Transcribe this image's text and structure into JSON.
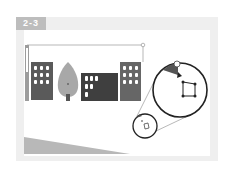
{
  "figure": {
    "label": "2-3",
    "colors": {
      "frame": "#efefef",
      "label_bg": "#bdbdbd",
      "building_dark": "#4a4a4a",
      "building_mid": "#6b6b6b",
      "tree": "#a8a8a8",
      "ground": "#b5b5b5",
      "outline": "#333333"
    },
    "elements": [
      "selection-bounding-box",
      "vertical-scroll-bar",
      "building-left",
      "tree",
      "building-center",
      "building-right",
      "magnifier-large-circle",
      "magnifier-small-circle",
      "ground-triangle"
    ]
  }
}
